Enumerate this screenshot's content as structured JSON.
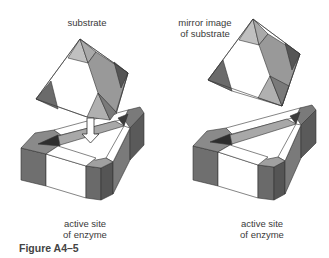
{
  "figure": {
    "caption": "Figure A4–5",
    "left_panel": {
      "top_label": "substrate",
      "bottom_label_line1": "active site",
      "bottom_label_line2": "of enzyme",
      "arrow": "down-arrow"
    },
    "right_panel": {
      "top_label_line1": "mirror image",
      "top_label_line2": "of substrate",
      "bottom_label_line1": "active site",
      "bottom_label_line2": "of enzyme"
    }
  },
  "colors": {
    "white": "#ffffff",
    "light": "#b8b8b8",
    "mid": "#8f8f8f",
    "dark": "#6a6a6a",
    "darker": "#4f4f4f",
    "darkest": "#2e2e2e",
    "stroke": "#333333"
  }
}
